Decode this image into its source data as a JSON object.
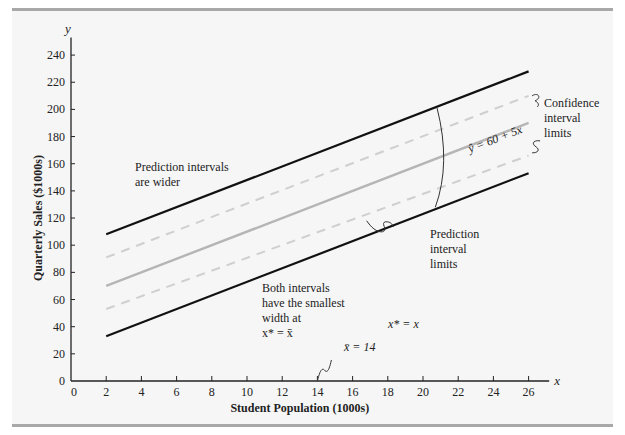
{
  "chart_data": {
    "type": "line",
    "title": "",
    "xlabel": "Student Population (1000s)",
    "ylabel": "Quarterly Sales ($1000s)",
    "x_axis_symbol": "x",
    "y_axis_symbol": "y",
    "xlim": [
      0,
      27
    ],
    "ylim": [
      0,
      250
    ],
    "x_ticks": [
      0,
      2,
      4,
      6,
      8,
      10,
      12,
      14,
      16,
      18,
      20,
      22,
      24,
      26
    ],
    "y_ticks": [
      0,
      20,
      40,
      60,
      80,
      100,
      120,
      140,
      160,
      180,
      200,
      220,
      240
    ],
    "grid": false,
    "x": [
      2,
      26
    ],
    "series": [
      {
        "name": "Upper prediction interval limit",
        "style": "solid-black",
        "values": [
          108,
          228
        ]
      },
      {
        "name": "Upper confidence interval limit",
        "style": "dashed-light-gray",
        "values": [
          91,
          210
        ]
      },
      {
        "name": "Estimated regression equation",
        "style": "solid-gray",
        "values": [
          70,
          190
        ]
      },
      {
        "name": "Lower confidence interval limit",
        "style": "dashed-light-gray",
        "values": [
          53,
          166
        ]
      },
      {
        "name": "Lower prediction interval limit",
        "style": "solid-black",
        "values": [
          33,
          153
        ]
      }
    ],
    "equation_label": "ŷ = 60 + 5x",
    "annotations": {
      "prediction_wider": [
        "Prediction intervals",
        "are wider"
      ],
      "confidence_limits": [
        "Confidence",
        "interval",
        "limits"
      ],
      "prediction_limits": [
        "Prediction",
        "interval",
        "limits"
      ],
      "smallest_width": [
        "Both intervals",
        "have the smallest",
        "width at",
        "x* = x̄"
      ],
      "x_star": "x* = x",
      "x_bar": "x̄ = 14"
    }
  }
}
